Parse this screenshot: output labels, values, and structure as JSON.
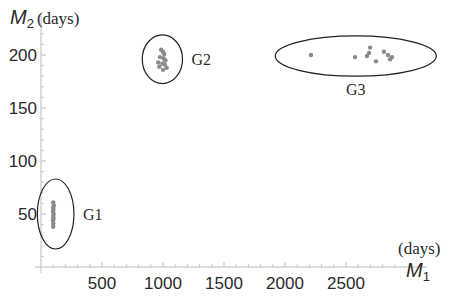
{
  "chart_data": {
    "type": "scatter",
    "title": "",
    "xlabel": "M",
    "xlabel_sub": "1",
    "xunit": "(days)",
    "ylabel": "M",
    "ylabel_sub": "2",
    "yunit": "(days)",
    "xlim": [
      0,
      3000
    ],
    "ylim": [
      0,
      225
    ],
    "xticks": [
      500,
      1000,
      1500,
      2000,
      2500
    ],
    "yticks": [
      50,
      100,
      150,
      200
    ],
    "grid": false,
    "point_color": "#8a8a8a",
    "ellipse_color": "#222222",
    "groups": [
      {
        "name": "G1",
        "points": [
          [
            100,
            61
          ],
          [
            105,
            58
          ],
          [
            100,
            56
          ],
          [
            102,
            54
          ],
          [
            98,
            52
          ],
          [
            104,
            50
          ],
          [
            100,
            48
          ],
          [
            103,
            46
          ],
          [
            99,
            44
          ],
          [
            101,
            41
          ],
          [
            100,
            38
          ]
        ],
        "ellipse": {
          "cx": 120,
          "cy": 50,
          "rx": 150,
          "ry": 33
        }
      },
      {
        "name": "G2",
        "points": [
          [
            985,
            205
          ],
          [
            1000,
            203
          ],
          [
            1010,
            201
          ],
          [
            975,
            198
          ],
          [
            1005,
            197
          ],
          [
            1020,
            195
          ],
          [
            960,
            193
          ],
          [
            995,
            192
          ],
          [
            1015,
            191
          ],
          [
            970,
            189
          ],
          [
            1000,
            186
          ],
          [
            1030,
            188
          ]
        ],
        "ellipse": {
          "cx": 995,
          "cy": 196,
          "rx": 165,
          "ry": 23
        }
      },
      {
        "name": "G3",
        "points": [
          [
            2213,
            200
          ],
          [
            2574,
            198
          ],
          [
            2672,
            199
          ],
          [
            2689,
            202
          ],
          [
            2697,
            207
          ],
          [
            2746,
            194
          ],
          [
            2811,
            203
          ],
          [
            2844,
            200
          ],
          [
            2861,
            196
          ],
          [
            2877,
            198
          ]
        ],
        "ellipse": {
          "cx": 2580,
          "cy": 199,
          "rx": 660,
          "ry": 19
        }
      }
    ]
  }
}
